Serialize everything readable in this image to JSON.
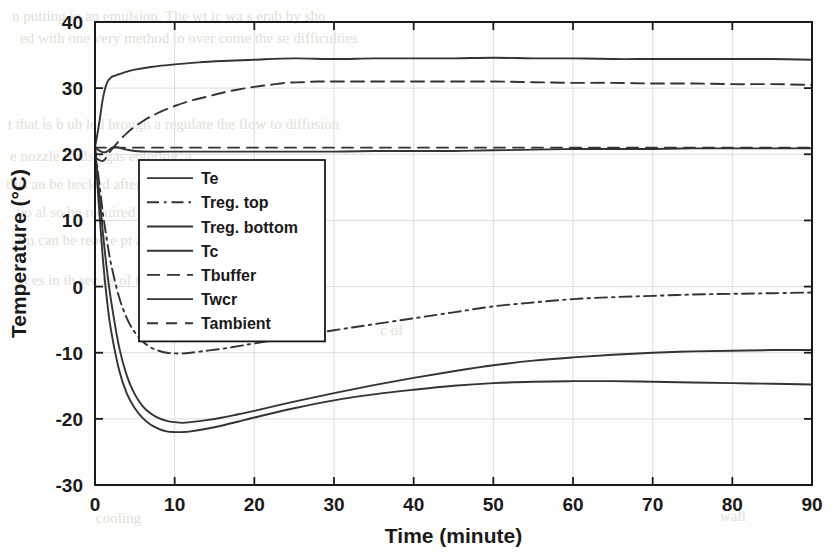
{
  "chart_data": {
    "type": "line",
    "title": "",
    "xlabel": "Time (minute)",
    "ylabel": "Temperature (°C)",
    "xlim": [
      0,
      90
    ],
    "ylim": [
      -30,
      40
    ],
    "xticks": [
      "0",
      "10",
      "20",
      "30",
      "40",
      "50",
      "60",
      "70",
      "80",
      "90"
    ],
    "yticks": [
      "40",
      "30",
      "20",
      "10",
      "0",
      "-10",
      "-20",
      "-30"
    ],
    "grid": true,
    "legend_position": "center-left-inside",
    "series": [
      {
        "name": "Te",
        "style": "solid",
        "x": [
          0,
          0.5,
          1,
          1.5,
          2,
          2.5,
          3,
          4,
          5,
          7,
          10,
          15,
          20,
          25,
          30,
          35,
          40,
          45,
          50,
          55,
          60,
          65,
          70,
          75,
          80,
          85,
          90
        ],
        "values": [
          21.0,
          20.6,
          20.3,
          20.4,
          20.9,
          21.1,
          21.0,
          20.7,
          20.5,
          20.4,
          20.4,
          20.4,
          20.4,
          20.4,
          20.4,
          20.5,
          20.5,
          20.5,
          20.6,
          20.7,
          20.8,
          20.8,
          20.8,
          20.9,
          20.9,
          20.9,
          20.9
        ]
      },
      {
        "name": "Treg. top",
        "style": "dashdot",
        "x": [
          0,
          0.5,
          1,
          1.5,
          2,
          3,
          4,
          5,
          6,
          7,
          8,
          9,
          10,
          11,
          12,
          14,
          16,
          18,
          20,
          25,
          30,
          35,
          40,
          45,
          50,
          55,
          60,
          65,
          70,
          75,
          80,
          85,
          90
        ],
        "values": [
          21.0,
          16.0,
          11.0,
          7.0,
          3.5,
          -1.5,
          -4.8,
          -6.9,
          -8.3,
          -9.2,
          -9.7,
          -10.0,
          -10.1,
          -10.1,
          -10.0,
          -9.7,
          -9.4,
          -9.0,
          -8.6,
          -7.6,
          -6.6,
          -5.7,
          -4.8,
          -3.9,
          -3.0,
          -2.4,
          -1.9,
          -1.6,
          -1.4,
          -1.2,
          -1.1,
          -1.0,
          -0.9
        ]
      },
      {
        "name": "Treg. bottom",
        "style": "solid",
        "x": [
          0,
          0.5,
          1,
          1.5,
          2,
          3,
          4,
          5,
          6,
          7,
          8,
          9,
          10,
          11,
          12,
          14,
          16,
          18,
          20,
          25,
          30,
          35,
          40,
          45,
          50,
          55,
          60,
          65,
          70,
          75,
          80,
          85,
          90
        ],
        "values": [
          21.0,
          12.0,
          4.0,
          -2.0,
          -6.5,
          -12.5,
          -16.2,
          -18.4,
          -19.9,
          -20.9,
          -21.5,
          -21.9,
          -22.0,
          -22.0,
          -21.9,
          -21.5,
          -21.0,
          -20.4,
          -19.8,
          -18.4,
          -17.2,
          -16.3,
          -15.6,
          -15.0,
          -14.6,
          -14.4,
          -14.3,
          -14.3,
          -14.4,
          -14.5,
          -14.6,
          -14.7,
          -14.8
        ]
      },
      {
        "name": "Tc",
        "style": "solid",
        "x": [
          0,
          0.5,
          1,
          1.5,
          2,
          2.5,
          3,
          4,
          5,
          7,
          10,
          13,
          16,
          20,
          25,
          30,
          35,
          40,
          45,
          50,
          55,
          60,
          65,
          70,
          75,
          80,
          85,
          90
        ],
        "values": [
          21.0,
          24.5,
          28.5,
          30.8,
          31.6,
          31.9,
          32.1,
          32.5,
          32.8,
          33.2,
          33.6,
          33.9,
          34.1,
          34.3,
          34.5,
          34.4,
          34.5,
          34.5,
          34.5,
          34.6,
          34.5,
          34.5,
          34.4,
          34.4,
          34.4,
          34.4,
          34.4,
          34.3
        ]
      },
      {
        "name": "Tbuffer",
        "style": "dashed",
        "x": [
          0,
          1,
          2,
          3,
          4,
          5,
          6,
          7,
          8,
          10,
          12,
          14,
          16,
          18,
          20,
          22,
          24,
          26,
          28,
          30,
          35,
          40,
          45,
          50,
          55,
          60,
          65,
          70,
          75,
          80,
          85,
          90
        ],
        "values": [
          19.5,
          19.0,
          20.6,
          22.0,
          23.2,
          24.2,
          25.0,
          25.7,
          26.3,
          27.3,
          28.1,
          28.7,
          29.3,
          29.8,
          30.2,
          30.5,
          30.8,
          30.9,
          31.0,
          31.0,
          31.0,
          31.0,
          31.0,
          31.0,
          30.9,
          30.8,
          30.8,
          30.7,
          30.7,
          30.6,
          30.6,
          30.5
        ]
      },
      {
        "name": "Twcr",
        "style": "solid",
        "x": [
          0,
          0.5,
          1,
          1.5,
          2,
          3,
          4,
          5,
          6,
          7,
          8,
          9,
          10,
          11,
          12,
          14,
          16,
          18,
          20,
          25,
          30,
          35,
          40,
          45,
          50,
          55,
          60,
          65,
          70,
          75,
          80,
          85,
          90
        ],
        "values": [
          21.0,
          14.5,
          8.0,
          2.5,
          -2.0,
          -9.0,
          -13.5,
          -16.3,
          -18.1,
          -19.2,
          -19.9,
          -20.3,
          -20.5,
          -20.6,
          -20.5,
          -20.2,
          -19.8,
          -19.3,
          -18.8,
          -17.4,
          -16.1,
          -14.9,
          -13.8,
          -12.8,
          -11.9,
          -11.2,
          -10.7,
          -10.3,
          -10.0,
          -9.8,
          -9.7,
          -9.6,
          -9.6
        ]
      },
      {
        "name": "Tambient",
        "style": "dashed-light",
        "x": [
          0,
          10,
          20,
          30,
          40,
          50,
          60,
          70,
          80,
          90
        ],
        "values": [
          21.0,
          21.0,
          21.0,
          21.0,
          21.0,
          21.0,
          21.0,
          21.0,
          21.0,
          21.0
        ]
      }
    ]
  },
  "legend": {
    "items": [
      {
        "label": "Te",
        "style": "solid"
      },
      {
        "label": "Treg. top",
        "style": "dashdot"
      },
      {
        "label": "Treg. bottom",
        "style": "solid"
      },
      {
        "label": "Tc",
        "style": "solid"
      },
      {
        "label": "Tbuffer",
        "style": "dashed"
      },
      {
        "label": "Twcr",
        "style": "solid"
      },
      {
        "label": "Tambient",
        "style": "dashed-light"
      }
    ]
  },
  "colors": {
    "axis": "#1a1a1a",
    "grid": "#dedede",
    "line": "#333333",
    "background": "#fdfdfb",
    "bleed_text": "#c9c9c4"
  },
  "background_bleed": {
    "lines": [
      {
        "text": "n putting in an emulsion. The  wt  ic  wa  s  erab  by  sho",
        "x": 12,
        "y": 8
      },
      {
        "text": "ed with one very  method to  over  come  the  se  difficulties",
        "x": 20,
        "y": 30
      },
      {
        "text": "t  that  is  b  ub  led  hrough  a  regulate the  flow  to  diffusion",
        "x": 8,
        "y": 116
      },
      {
        "text": "e  nozzle is  also  gas  entering,  a",
        "x": 10,
        "y": 148
      },
      {
        "text": "this  an  be  hecked  after  Let  it  be  noted  that  the  gas  en",
        "x": 6,
        "y": 176
      },
      {
        "text": "lio  al  so  be  required  to  prevent  uip  ment  of  the  cell",
        "x": 16,
        "y": 204
      },
      {
        "text": "r  n  can  be  read  e  pt  a  sin  cell  from",
        "x": 18,
        "y": 232
      },
      {
        "text": "i  es  in  th  sec  ns  of  th  dry",
        "x": 24,
        "y": 272
      },
      {
        "text": "c  of",
        "x": 380,
        "y": 322
      },
      {
        "text": "cooling",
        "x": 96,
        "y": 510
      },
      {
        "text": "wall",
        "x": 720,
        "y": 508
      }
    ]
  }
}
